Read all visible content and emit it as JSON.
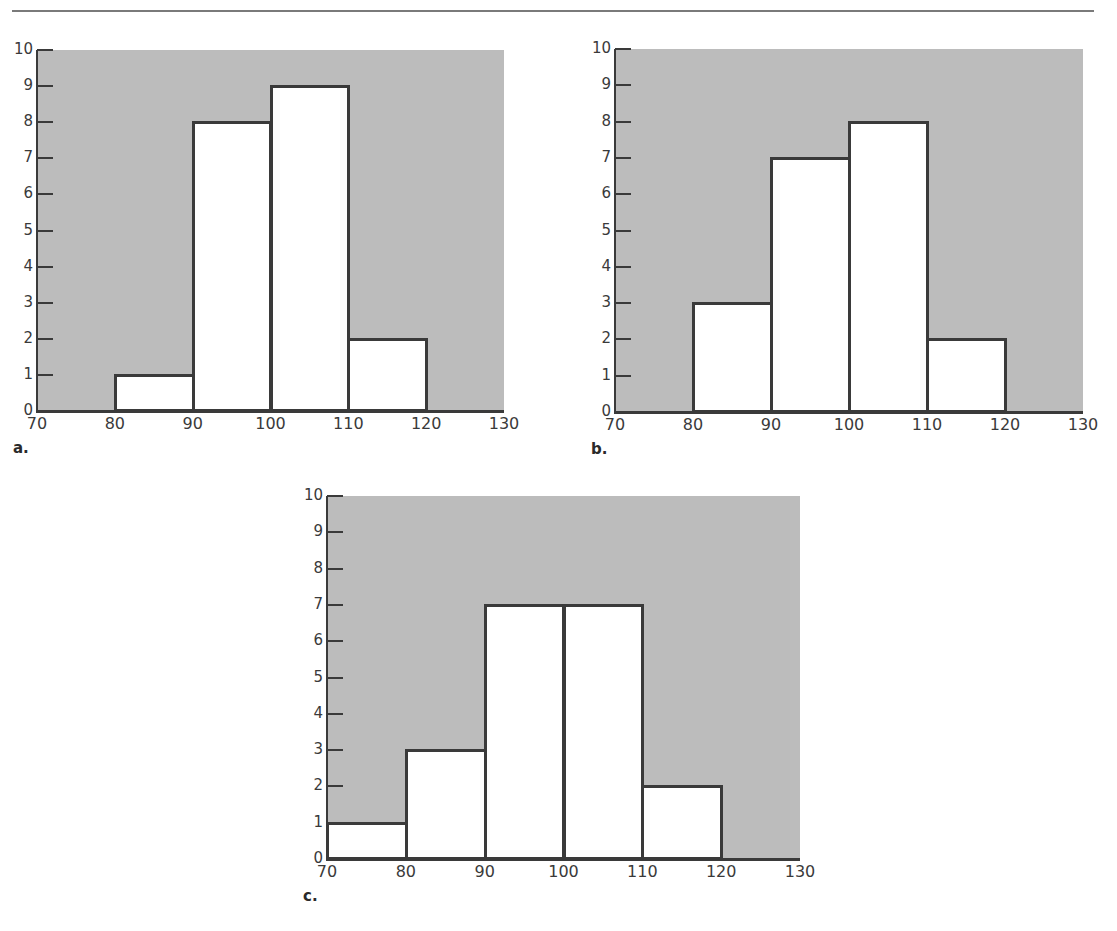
{
  "chart_data": [
    {
      "id": "a",
      "type": "bar",
      "subtype": "histogram",
      "panel_label": "a.",
      "bins": [
        [
          80,
          90
        ],
        [
          90,
          100
        ],
        [
          100,
          110
        ],
        [
          110,
          120
        ]
      ],
      "values": [
        1,
        8,
        9,
        2
      ],
      "xticks": [
        70,
        80,
        90,
        100,
        110,
        120,
        130
      ],
      "yticks": [
        0,
        1,
        2,
        3,
        4,
        5,
        6,
        7,
        8,
        9,
        10
      ],
      "xlim": [
        70,
        130
      ],
      "ylim": [
        0,
        10
      ],
      "title": "",
      "xlabel": "",
      "ylabel": "",
      "grid": false,
      "plot_background": "#bcbcbc",
      "bar_fill": "#ffffff",
      "bar_edge": "#3a3a3a"
    },
    {
      "id": "b",
      "type": "bar",
      "subtype": "histogram",
      "panel_label": "b.",
      "bins": [
        [
          80,
          90
        ],
        [
          90,
          100
        ],
        [
          100,
          110
        ],
        [
          110,
          120
        ]
      ],
      "values": [
        3,
        7,
        8,
        2
      ],
      "xticks": [
        70,
        80,
        90,
        100,
        110,
        120,
        130
      ],
      "yticks": [
        0,
        1,
        2,
        3,
        4,
        5,
        6,
        7,
        8,
        9,
        10
      ],
      "xlim": [
        70,
        130
      ],
      "ylim": [
        0,
        10
      ],
      "title": "",
      "xlabel": "",
      "ylabel": "",
      "grid": false,
      "plot_background": "#bcbcbc",
      "bar_fill": "#ffffff",
      "bar_edge": "#3a3a3a"
    },
    {
      "id": "c",
      "type": "bar",
      "subtype": "histogram",
      "panel_label": "c.",
      "bins": [
        [
          70,
          80
        ],
        [
          80,
          90
        ],
        [
          90,
          100
        ],
        [
          100,
          110
        ],
        [
          110,
          120
        ]
      ],
      "values": [
        1,
        3,
        7,
        7,
        2
      ],
      "xticks": [
        70,
        80,
        90,
        100,
        110,
        120,
        130
      ],
      "yticks": [
        0,
        1,
        2,
        3,
        4,
        5,
        6,
        7,
        8,
        9,
        10
      ],
      "xlim": [
        70,
        130
      ],
      "ylim": [
        0,
        10
      ],
      "title": "",
      "xlabel": "",
      "ylabel": "",
      "grid": false,
      "plot_background": "#bcbcbc",
      "bar_fill": "#ffffff",
      "bar_edge": "#3a3a3a"
    }
  ],
  "layout": {
    "panels": [
      {
        "x0": 37,
        "x1": 504,
        "ytop": 50,
        "y0": 411
      },
      {
        "x0": 615,
        "x1": 1083,
        "ytop": 49,
        "y0": 412
      },
      {
        "x0": 327,
        "x1": 800,
        "ytop": 496,
        "y0": 859
      }
    ]
  }
}
